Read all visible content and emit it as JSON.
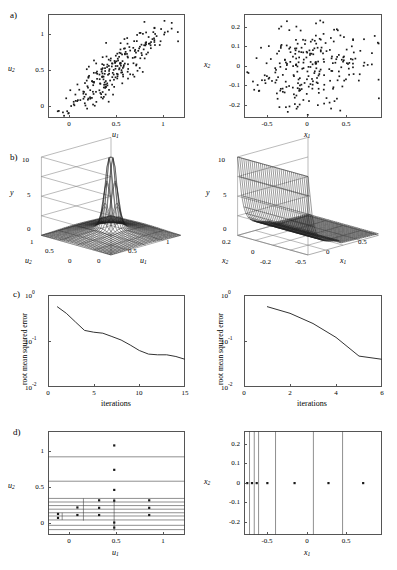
{
  "figure": {
    "panels": [
      "a)",
      "b)",
      "c)",
      "d)"
    ],
    "ink_color": "#1a1a1a",
    "axis_color": "#555555"
  },
  "panel_labels": {
    "a": "a)",
    "b": "b)",
    "c": "c)",
    "d": "d)"
  },
  "chart_data": [
    {
      "id": "a-left",
      "type": "scatter",
      "title": "",
      "xlabel": "u_1",
      "ylabel": "u_2",
      "xlim": [
        -0.25,
        1.2
      ],
      "ylim": [
        -0.25,
        1.2
      ],
      "xticks": [
        0,
        0.5,
        1
      ],
      "xticklabels": [
        "0",
        "0.5",
        "1"
      ],
      "yticks": [
        0,
        0.5,
        1
      ],
      "yticklabels": [
        "0",
        "0.5",
        "1"
      ],
      "grid": false,
      "n_points": 250,
      "correlation": 0.88,
      "description": "Positively correlated elongated point cloud from lower-left to upper-right"
    },
    {
      "id": "a-right",
      "type": "scatter",
      "title": "",
      "xlabel": "x_1",
      "ylabel": "x_2",
      "xlim": [
        -0.85,
        0.9
      ],
      "ylim": [
        -0.27,
        0.27
      ],
      "xticks": [
        -0.5,
        0,
        0.5
      ],
      "xticklabels": [
        "-0.5",
        "0",
        "0.5"
      ],
      "yticks": [
        -0.2,
        -0.1,
        0,
        0.1,
        0.2
      ],
      "yticklabels": [
        "-0.2",
        "-0.1",
        "0",
        "0.1",
        "0.2"
      ],
      "grid": false,
      "n_points": 250,
      "correlation": 0.0,
      "description": "Uncorrelated isotropic point cloud (whitened coordinates)"
    },
    {
      "id": "b-left",
      "type": "surface3d",
      "title": "",
      "xlabel": "u_1",
      "ylabel": "u_2",
      "zlabel": "y",
      "xticks": [
        0,
        0.5,
        1
      ],
      "xticklabels": [
        "0",
        "0.5",
        "1"
      ],
      "yticks": [
        0,
        0.5,
        1
      ],
      "yticklabels": [
        "0",
        "0.5",
        "1"
      ],
      "zticks": [
        0,
        5,
        10
      ],
      "zticklabels": [
        "0",
        "5",
        "10"
      ],
      "zlim": [
        0,
        10
      ],
      "description": "Sharp narrow density spike near the centre of the u1-u2 square on a low plateau"
    },
    {
      "id": "b-right",
      "type": "surface3d",
      "title": "",
      "xlabel": "x_1",
      "ylabel": "x_2",
      "zlabel": "y",
      "xticks": [
        -0.5,
        0,
        0.5
      ],
      "xticklabels": [
        "-0.5",
        "0",
        "0.5"
      ],
      "yticks": [
        -0.2,
        0,
        0.2
      ],
      "yticklabels": [
        "-0.2",
        "0",
        "0.2"
      ],
      "zticks": [
        0,
        5,
        10
      ],
      "zticklabels": [
        "0",
        "5",
        "10"
      ],
      "zlim": [
        0,
        10
      ],
      "description": "Ridge rising steeply to 10 at the left edge with a step drop to a flat low plateau"
    },
    {
      "id": "c-left",
      "type": "line",
      "title": "",
      "xlabel": "iterations",
      "ylabel": "root mean squared error",
      "xlim": [
        0,
        15
      ],
      "ylim": [
        0.01,
        1
      ],
      "yscale": "log",
      "xticks": [
        0,
        5,
        10,
        15
      ],
      "xticklabels": [
        "0",
        "5",
        "10",
        "15"
      ],
      "yticks": [
        0.01,
        0.1,
        1
      ],
      "yticklabels": [
        "10-2",
        "10-1",
        "100"
      ],
      "grid": false,
      "x": [
        1,
        2,
        3,
        4,
        5,
        6,
        7,
        8,
        9,
        10,
        11,
        12,
        13,
        14,
        15
      ],
      "values": [
        0.56,
        0.4,
        0.26,
        0.17,
        0.155,
        0.148,
        0.125,
        0.105,
        0.082,
        0.062,
        0.052,
        0.05,
        0.05,
        0.046,
        0.04
      ]
    },
    {
      "id": "c-right",
      "type": "line",
      "title": "",
      "xlabel": "iterations",
      "ylabel": "root mean squared error",
      "xlim": [
        0,
        6
      ],
      "ylim": [
        0.01,
        1
      ],
      "yscale": "log",
      "xticks": [
        0,
        2,
        4,
        6
      ],
      "xticklabels": [
        "0",
        "2",
        "4",
        "6"
      ],
      "yticks": [
        0.01,
        0.1,
        1
      ],
      "yticklabels": [
        "10-2",
        "10-1",
        "100"
      ],
      "grid": false,
      "x": [
        1,
        2,
        3,
        4,
        5,
        6
      ],
      "values": [
        0.56,
        0.4,
        0.24,
        0.12,
        0.047,
        0.04
      ]
    },
    {
      "id": "d-left",
      "type": "scatter",
      "title": "",
      "xlabel": "u_1",
      "ylabel": "u_2",
      "xlim": [
        -0.25,
        1.2
      ],
      "ylim": [
        -0.25,
        1.2
      ],
      "xticks": [
        0,
        0.5,
        1
      ],
      "xticklabels": [
        "0",
        "0.5",
        "1"
      ],
      "yticks": [
        0,
        0.5,
        1
      ],
      "yticklabels": [
        "0",
        "0.5",
        "1"
      ],
      "grid": false,
      "description": "Adaptive partition: many horizontal cut lines clustered near u2=0 plus a few vertical cuts; node centres marked with dots",
      "hlines": [
        0.84,
        0.5,
        0.26,
        0.21,
        0.16,
        0.11,
        0.06,
        0.015,
        -0.04,
        -0.115,
        -0.175
      ],
      "vlines": [
        {
          "x": 0.125,
          "y0": -0.05,
          "y1": 0.26
        },
        {
          "x": 0.45,
          "y0": -0.19,
          "y1": 0.26
        },
        {
          "x": -0.1,
          "y0": -0.04,
          "y1": 0.06
        }
      ],
      "points": [
        [
          0.45,
          1.0
        ],
        [
          0.45,
          0.66
        ],
        [
          0.45,
          0.38
        ],
        [
          0.45,
          0.23
        ],
        [
          0.29,
          0.235
        ],
        [
          0.82,
          0.235
        ],
        [
          0.82,
          0.13
        ],
        [
          0.82,
          0.03
        ],
        [
          0.06,
          0.135
        ],
        [
          0.29,
          0.13
        ],
        [
          0.06,
          0.03
        ],
        [
          0.29,
          0.03
        ],
        [
          -0.145,
          0.045
        ],
        [
          -0.145,
          -0.01
        ],
        [
          0.45,
          -0.075
        ],
        [
          0.45,
          -0.145
        ]
      ]
    },
    {
      "id": "d-right",
      "type": "scatter",
      "title": "",
      "xlabel": "x_1",
      "ylabel": "x_2",
      "xlim": [
        -0.85,
        0.9
      ],
      "ylim": [
        -0.27,
        0.27
      ],
      "xticks": [
        -0.5,
        0,
        0.5
      ],
      "xticklabels": [
        "-0.5",
        "0",
        "0.5"
      ],
      "yticks": [
        -0.2,
        -0.1,
        0,
        0.1,
        0.2
      ],
      "yticklabels": [
        "-0.2",
        "-0.1",
        "0",
        "0.1",
        "0.2"
      ],
      "grid": false,
      "description": "Partition consisting only of vertical cuts along x1; all node centres lie on x2 = 0",
      "vlines": [
        -0.78,
        -0.72,
        -0.665,
        -0.45,
        0.03,
        0.4
      ],
      "points": [
        [
          -0.81,
          0
        ],
        [
          -0.75,
          0
        ],
        [
          -0.69,
          0
        ],
        [
          -0.555,
          0
        ],
        [
          -0.21,
          0
        ],
        [
          0.22,
          0
        ],
        [
          0.66,
          0
        ]
      ]
    }
  ],
  "axis_text": {
    "u1": "u",
    "u1sub": "1",
    "u2": "u",
    "u2sub": "2",
    "x1": "x",
    "x1sub": "1",
    "x2": "x",
    "x2sub": "2",
    "y": "y",
    "iterations": "iterations",
    "rmse": "root mean squared error",
    "ten": "10"
  }
}
